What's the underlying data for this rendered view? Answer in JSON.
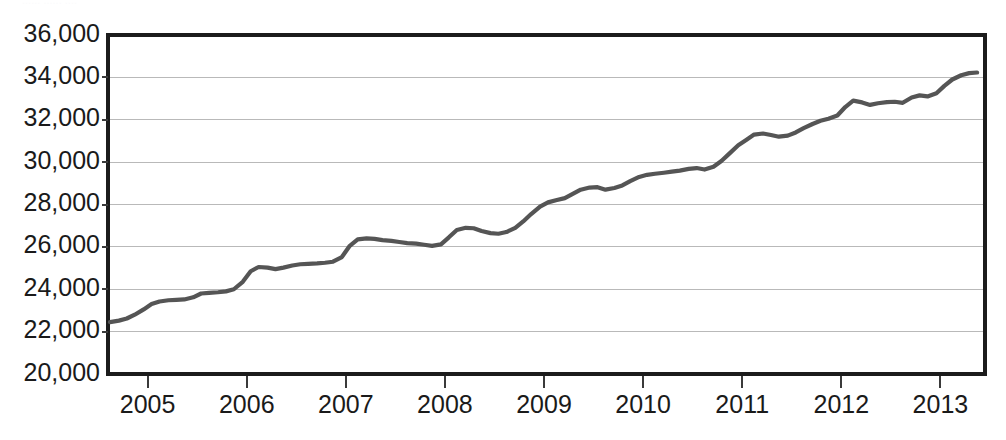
{
  "page": {
    "background_color": "#ffffff",
    "cropped_header_fragment": "......  ......  ...."
  },
  "chart_data": {
    "type": "line",
    "title": "",
    "subtitle": "",
    "xlabel": "",
    "ylabel": "",
    "grid": true,
    "legend": "none",
    "line_color": "#555555",
    "axis_color": "#1c1c1c",
    "gridline_color": "#b9b9b9",
    "xlim": [
      2004.6,
      2013.45
    ],
    "ylim": [
      20000,
      36000
    ],
    "ytick_values": [
      20000,
      22000,
      24000,
      26000,
      28000,
      30000,
      32000,
      34000,
      36000
    ],
    "ytick_labels": [
      "20,000",
      "22,000",
      "24,000",
      "26,000",
      "28,000",
      "30,000",
      "32,000",
      "34,000",
      "36,000"
    ],
    "xtick_values": [
      2005,
      2006,
      2007,
      2008,
      2009,
      2010,
      2011,
      2012,
      2013
    ],
    "xtick_labels": [
      "2005",
      "2006",
      "2007",
      "2008",
      "2009",
      "2010",
      "2011",
      "2012",
      "2013"
    ],
    "series": [
      {
        "name": "series-1",
        "color": "#555555",
        "x": [
          2004.62,
          2004.71,
          2004.79,
          2004.87,
          2004.96,
          2005.04,
          2005.12,
          2005.21,
          2005.29,
          2005.37,
          2005.46,
          2005.54,
          2005.62,
          2005.71,
          2005.79,
          2005.87,
          2005.96,
          2006.04,
          2006.12,
          2006.21,
          2006.29,
          2006.37,
          2006.46,
          2006.54,
          2006.62,
          2006.71,
          2006.79,
          2006.87,
          2006.96,
          2007.04,
          2007.12,
          2007.21,
          2007.29,
          2007.37,
          2007.46,
          2007.54,
          2007.62,
          2007.71,
          2007.79,
          2007.87,
          2007.96,
          2008.04,
          2008.12,
          2008.21,
          2008.29,
          2008.37,
          2008.46,
          2008.54,
          2008.62,
          2008.71,
          2008.79,
          2008.87,
          2008.96,
          2009.04,
          2009.12,
          2009.21,
          2009.29,
          2009.37,
          2009.46,
          2009.54,
          2009.62,
          2009.71,
          2009.79,
          2009.87,
          2009.96,
          2010.04,
          2010.12,
          2010.21,
          2010.29,
          2010.37,
          2010.46,
          2010.54,
          2010.62,
          2010.71,
          2010.79,
          2010.87,
          2010.96,
          2011.04,
          2011.12,
          2011.21,
          2011.29,
          2011.37,
          2011.46,
          2011.54,
          2011.62,
          2011.71,
          2011.79,
          2011.87,
          2011.96,
          2012.04,
          2012.12,
          2012.21,
          2012.29,
          2012.37,
          2012.46,
          2012.54,
          2012.62,
          2012.71,
          2012.79,
          2012.87,
          2012.96,
          2013.04,
          2013.12,
          2013.21,
          2013.29,
          2013.37
        ],
        "values": [
          22450,
          22520,
          22620,
          22800,
          23050,
          23300,
          23420,
          23480,
          23500,
          23520,
          23620,
          23800,
          23830,
          23860,
          23900,
          24000,
          24350,
          24850,
          25050,
          25020,
          24950,
          25020,
          25120,
          25180,
          25200,
          25220,
          25250,
          25300,
          25520,
          26050,
          26350,
          26400,
          26380,
          26320,
          26280,
          26230,
          26180,
          26150,
          26100,
          26050,
          26120,
          26450,
          26800,
          26900,
          26880,
          26750,
          26650,
          26620,
          26700,
          26900,
          27200,
          27550,
          27900,
          28100,
          28200,
          28300,
          28500,
          28700,
          28800,
          28820,
          28700,
          28780,
          28900,
          29100,
          29300,
          29400,
          29450,
          29500,
          29550,
          29600,
          29680,
          29720,
          29650,
          29780,
          30050,
          30400,
          30800,
          31050,
          31300,
          31350,
          31280,
          31200,
          31250,
          31400,
          31600,
          31800,
          31950,
          32050,
          32200,
          32600,
          32900,
          32820,
          32700,
          32780,
          32830,
          32850,
          32800,
          33050,
          33150,
          33100,
          33250,
          33600,
          33900,
          34100,
          34200,
          34230
        ]
      }
    ]
  }
}
